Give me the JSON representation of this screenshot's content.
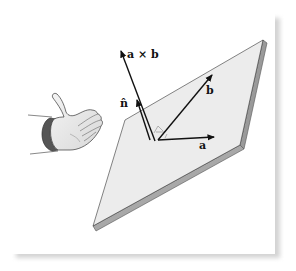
{
  "figure": {
    "labels": {
      "cross": "a × b",
      "normal": "n̂",
      "vec_a": "a",
      "vec_b": "b"
    },
    "colors": {
      "plate_face": "#ececec",
      "plate_edge": "#9a9a9a",
      "arrow": "#111111",
      "frame_shadow": "#d4d4d4",
      "background": "#ffffff"
    },
    "elements": [
      "right hand",
      "tilted plate",
      "vector a",
      "vector b",
      "vector a × b",
      "unit normal n̂",
      "right-angle marks"
    ]
  }
}
